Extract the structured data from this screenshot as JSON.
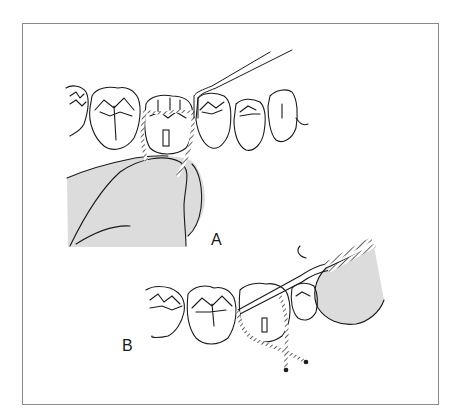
{
  "figure": {
    "frame_color": "#8a8a8a",
    "line_color": "#1a1a1a",
    "shade_color": "#dcdcdc",
    "panels": [
      {
        "id": "A",
        "label": "A",
        "description": "Row of posterior teeth with a rope-like floss/ligature looped around a prepared tooth (with post hole), held by a finger from below, and a dental explorer instrument touching the adjacent tooth."
      },
      {
        "id": "B",
        "label": "B",
        "description": "Row of posterior teeth with an instrument held by a gloved finger pressing the twisted ligature cord around the prepared tooth; cord ends crossed and trailing below."
      }
    ]
  }
}
